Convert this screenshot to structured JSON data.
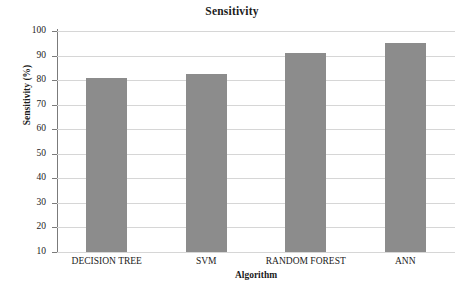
{
  "chart_data": {
    "type": "bar",
    "title": "Sensitivity",
    "xlabel": "Algorithm",
    "ylabel": "Sensitivity (%)",
    "categories": [
      "DECISION TREE",
      "SVM",
      "RANDOM FOREST",
      "ANN"
    ],
    "values": [
      81,
      82.5,
      91,
      95
    ],
    "ylim": [
      10,
      100
    ],
    "ytick_step": 10,
    "yticks": [
      10,
      20,
      30,
      40,
      50,
      60,
      70,
      80,
      90,
      100
    ],
    "ytick_labels": [
      "10",
      "20",
      "30",
      "40",
      "50",
      "60",
      "70",
      "80",
      "90",
      "100"
    ],
    "grid": true,
    "legend": false,
    "bar_color": "#8c8c8c",
    "background_color": "#ffffff",
    "gridline_color": "#d6d6d6",
    "axis_color": "#7b7b7b"
  }
}
